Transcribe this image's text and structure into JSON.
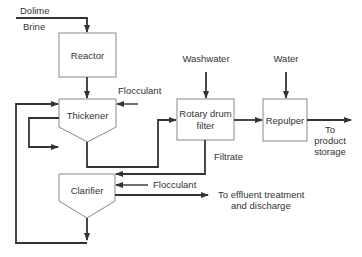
{
  "diagram": {
    "title": "",
    "units": {
      "reactor": {
        "label": "Reactor"
      },
      "thickener": {
        "label": "Thickener"
      },
      "clarifier": {
        "label": "Clarifier"
      },
      "rotary_drum_filter": {
        "label_line1": "Rotary drum",
        "label_line2": "filter"
      },
      "repulper": {
        "label": "Repulper"
      }
    },
    "streams": {
      "dolime": "Dolime",
      "brine": "Brine",
      "flocculant_thickener": "Flocculant",
      "washwater": "Washwater",
      "water": "Water",
      "filtrate": "Filtrate",
      "flocculant_clarifier": "Flocculant",
      "product_line1": "To",
      "product_line2": "product",
      "product_line3": "storage",
      "effluent_line1": "To effluent treatment",
      "effluent_line2": "and discharge"
    },
    "colors": {
      "line": "#333333",
      "box_border": "#888888",
      "text": "#333333",
      "background": "#ffffff"
    }
  }
}
